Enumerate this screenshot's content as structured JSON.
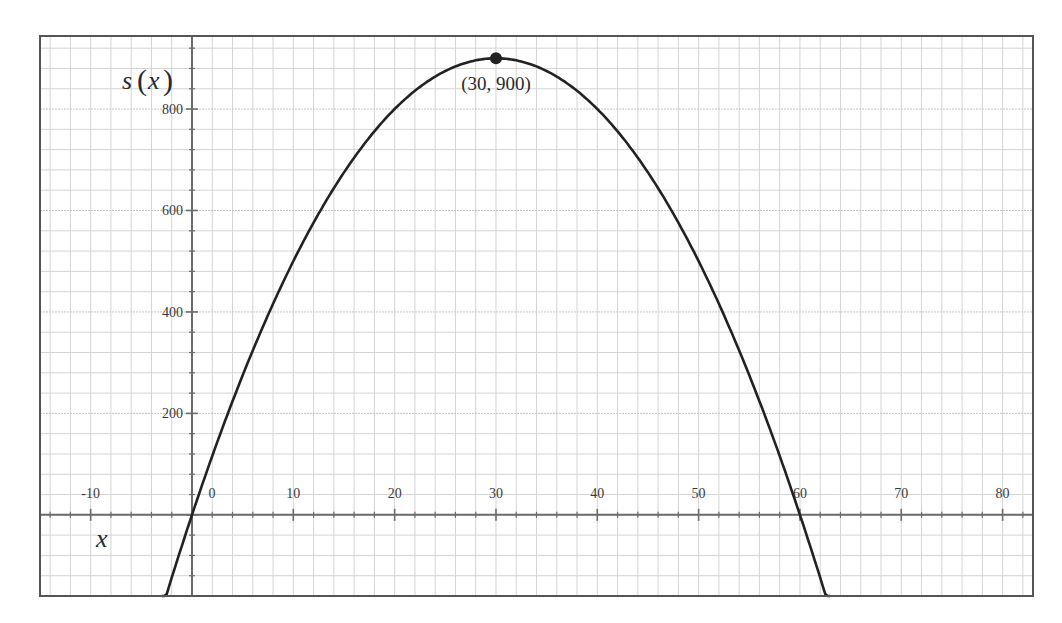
{
  "chart_data": {
    "type": "line",
    "title": "",
    "function": "s(x) = x(60 - x)",
    "xlabel": "x",
    "ylabel": "s(x)",
    "xlim": [
      -15,
      83
    ],
    "ylim": [
      -160,
      944
    ],
    "x_ticks": [
      -10,
      0,
      10,
      20,
      30,
      40,
      50,
      60,
      70,
      80
    ],
    "x_tick_labels": [
      "-10",
      "0",
      "10",
      "20",
      "30",
      "40",
      "50",
      "60",
      "70",
      "80"
    ],
    "y_ticks": [
      200,
      400,
      600,
      800
    ],
    "y_tick_labels": [
      "200",
      "400",
      "600",
      "800"
    ],
    "x_minor_step": 2,
    "y_minor_step": 40,
    "grid": true,
    "series": [
      {
        "name": "s(x)",
        "x": [
          -3,
          0,
          5,
          10,
          15,
          20,
          25,
          30,
          35,
          40,
          45,
          50,
          55,
          60,
          63
        ],
        "values": [
          -189,
          0,
          275,
          500,
          675,
          800,
          875,
          900,
          875,
          800,
          675,
          500,
          275,
          0,
          -189
        ],
        "color": "#222222"
      }
    ],
    "annotations": [
      {
        "type": "point",
        "x": 30,
        "y": 900,
        "label": "(30, 900)"
      }
    ],
    "legend": null
  },
  "colors": {
    "frame": "#555555",
    "axis": "#6b6b6b",
    "grid": "#d4d4d4",
    "curve": "#222222"
  }
}
